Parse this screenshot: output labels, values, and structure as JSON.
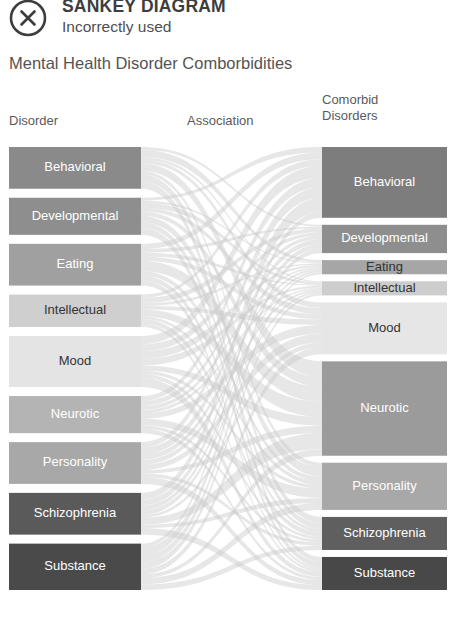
{
  "annotation": {
    "icon": "circle-x-icon",
    "title": "SANKEY DIAGRAM",
    "subtitle": "Incorrectly used"
  },
  "chart": {
    "title": "Mental Health Disorder Comborbidities",
    "headers": {
      "left": "Disorder",
      "middle": "Association",
      "right_line1": "Comorbid",
      "right_line2": "Disorders"
    }
  },
  "chart_data": {
    "type": "sankey",
    "title": "Mental Health Disorder Comborbidities",
    "xlabel": "",
    "ylabel": "",
    "legend_position": "none",
    "grid": false,
    "columns": [
      "Disorder",
      "Association",
      "Comorbid Disorders"
    ],
    "nodes_left": [
      {
        "label": "Behavioral",
        "value": 9,
        "color": "#8a8a8a",
        "text_color": "#ffffff"
      },
      {
        "label": "Developmental",
        "value": 8,
        "color": "#8e8e8e",
        "text_color": "#ffffff"
      },
      {
        "label": "Eating",
        "value": 9,
        "color": "#a0a0a0",
        "text_color": "#ffffff"
      },
      {
        "label": "Intellectual",
        "value": 7,
        "color": "#cfcfcf",
        "text_color": "#333333"
      },
      {
        "label": "Mood",
        "value": 11,
        "color": "#e4e4e4",
        "text_color": "#333333"
      },
      {
        "label": "Neurotic",
        "value": 8,
        "color": "#b4b4b4",
        "text_color": "#ffffff"
      },
      {
        "label": "Personality",
        "value": 9,
        "color": "#a8a8a8",
        "text_color": "#ffffff"
      },
      {
        "label": "Schizophrenia",
        "value": 9,
        "color": "#5a5a5a",
        "text_color": "#ffffff"
      },
      {
        "label": "Substance",
        "value": 10,
        "color": "#4a4a4a",
        "text_color": "#ffffff"
      }
    ],
    "nodes_right": [
      {
        "label": "Behavioral",
        "value": 15,
        "color": "#7d7d7d",
        "text_color": "#ffffff"
      },
      {
        "label": "Developmental",
        "value": 6,
        "color": "#8e8e8e",
        "text_color": "#ffffff"
      },
      {
        "label": "Eating",
        "value": 3,
        "color": "#a6a6a6",
        "text_color": "#333333"
      },
      {
        "label": "Intellectual",
        "value": 3,
        "color": "#cdcdcd",
        "text_color": "#333333"
      },
      {
        "label": "Mood",
        "value": 11,
        "color": "#e6e6e6",
        "text_color": "#333333"
      },
      {
        "label": "Neurotic",
        "value": 20,
        "color": "#9b9b9b",
        "text_color": "#ffffff"
      },
      {
        "label": "Personality",
        "value": 10,
        "color": "#a8a8a8",
        "text_color": "#ffffff"
      },
      {
        "label": "Schizophrenia",
        "value": 7,
        "color": "#5f5f5f",
        "text_color": "#ffffff"
      },
      {
        "label": "Substance",
        "value": 7,
        "color": "#484848",
        "text_color": "#ffffff"
      }
    ],
    "link_color": "#c9c9c9",
    "link_opacity": 0.45,
    "note": "Dense many-to-many flows: every left disorder links to most right comorbid disorders, producing an unreadable tangle."
  }
}
